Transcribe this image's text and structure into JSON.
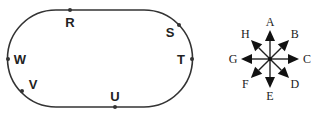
{
  "track": {
    "shape": "stadium",
    "points": [
      {
        "label": "R",
        "dot": [
          70,
          10
        ],
        "text": [
          70,
          27
        ]
      },
      {
        "label": "S",
        "dot": [
          179,
          25
        ],
        "text": [
          170,
          37
        ]
      },
      {
        "label": "T",
        "dot": [
          192,
          59
        ],
        "text": [
          181,
          64
        ]
      },
      {
        "label": "U",
        "dot": [
          115,
          107
        ],
        "text": [
          115,
          101
        ]
      },
      {
        "label": "V",
        "dot": [
          22,
          91
        ],
        "text": [
          33,
          89
        ]
      },
      {
        "label": "W",
        "dot": [
          8,
          59
        ],
        "text": [
          20,
          64
        ]
      }
    ]
  },
  "compass": {
    "center": [
      270,
      59
    ],
    "directions": [
      {
        "label": "A",
        "angle": -90
      },
      {
        "label": "B",
        "angle": -45
      },
      {
        "label": "C",
        "angle": 0
      },
      {
        "label": "D",
        "angle": 45
      },
      {
        "label": "E",
        "angle": 90
      },
      {
        "label": "F",
        "angle": 135
      },
      {
        "label": "G",
        "angle": 180
      },
      {
        "label": "H",
        "angle": -135
      }
    ]
  },
  "colors": {
    "line": "#333333",
    "text": "#222222"
  }
}
